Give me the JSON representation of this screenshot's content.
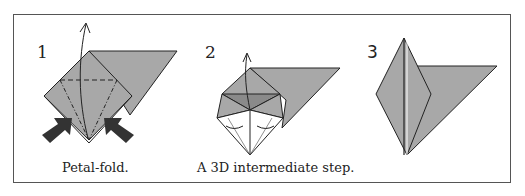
{
  "diagram": {
    "steps": [
      {
        "number": "1",
        "caption": "Petal-fold."
      },
      {
        "number": "2",
        "caption": "A 3D intermediate step."
      },
      {
        "number": "3",
        "caption": ""
      }
    ],
    "colors": {
      "paper": "#a8a8a8",
      "paper_dark": "#8a8a8a",
      "outline": "#222222",
      "frame": "#555555"
    }
  }
}
